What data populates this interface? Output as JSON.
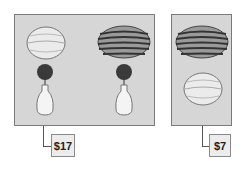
{
  "groups": [
    {
      "items": [
        "honeydew-melon",
        "watermelon",
        "flower-vase",
        "flower-vase"
      ],
      "price": "$17"
    },
    {
      "items": [
        "watermelon",
        "honeydew-melon"
      ],
      "price": "$7"
    }
  ],
  "colors": {
    "panel_bg": "#d6d6d6",
    "panel_border": "#7a7a7a",
    "price_bg": "#ececec"
  }
}
